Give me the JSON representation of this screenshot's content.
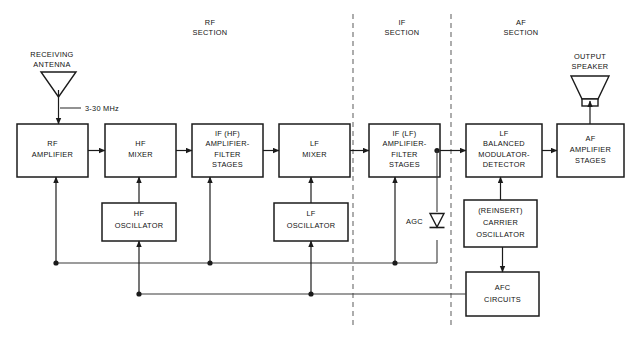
{
  "diagram": {
    "sections": [
      {
        "id": "rf",
        "line1": "RF",
        "line2": "SECTION"
      },
      {
        "id": "if",
        "line1": "IF",
        "line2": "SECTION"
      },
      {
        "id": "af",
        "line1": "AF",
        "line2": "SECTION"
      }
    ],
    "blocks": [
      {
        "id": "rf-amplifier",
        "lines": [
          "RF",
          "AMPLIFIER"
        ]
      },
      {
        "id": "hf-mixer",
        "lines": [
          "HF",
          "MIXER"
        ]
      },
      {
        "id": "if-hf-stages",
        "lines": [
          "IF (HF)",
          "AMPLIFIER-",
          "FILTER",
          "STAGES"
        ]
      },
      {
        "id": "lf-mixer",
        "lines": [
          "LF",
          "MIXER"
        ]
      },
      {
        "id": "if-lf-stages",
        "lines": [
          "IF (LF)",
          "AMPLIFIER-",
          "FILTER",
          "STAGES"
        ]
      },
      {
        "id": "lf-balanced-modulator-detector",
        "lines": [
          "LF",
          "BALANCED",
          "MODULATOR-",
          "DETECTOR"
        ]
      },
      {
        "id": "af-amplifier-stages",
        "lines": [
          "AF",
          "AMPLIFIER",
          "STAGES"
        ]
      },
      {
        "id": "hf-oscillator",
        "lines": [
          "HF",
          "OSCILLATOR"
        ]
      },
      {
        "id": "lf-oscillator",
        "lines": [
          "LF",
          "OSCILLATOR"
        ]
      },
      {
        "id": "reinsert-carrier-oscillator",
        "lines": [
          "(REINSERT)",
          "CARRIER",
          "OSCILLATOR"
        ]
      },
      {
        "id": "afc-circuits",
        "lines": [
          "AFC",
          "CIRCUITS"
        ]
      }
    ],
    "annotations": {
      "receiving_antenna_line1": "RECEIVING",
      "receiving_antenna_line2": "ANTENNA",
      "input_frequency": "3-30 MHz",
      "output_speaker_line1": "OUTPUT",
      "output_speaker_line2": "SPEAKER",
      "agc_label": "AGC"
    },
    "colors": {
      "background": "#ffffff",
      "box_stroke": "#1b1b1b",
      "wire": "#3a3a3a",
      "divider": "#6a6a6a",
      "text": "#111111"
    }
  }
}
